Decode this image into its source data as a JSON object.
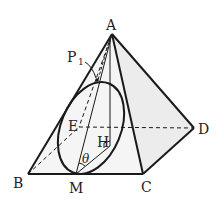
{
  "diagram": {
    "type": "square pyramid with inscribed ellipse cross-section",
    "colors": {
      "stroke": "#1a1a1a",
      "face_fill": "#ebebeb",
      "background": "#ffffff"
    },
    "points": {
      "A": {
        "label": "A",
        "x": 112,
        "y": 34
      },
      "B": {
        "label": "B",
        "x": 28,
        "y": 174
      },
      "C": {
        "label": "C",
        "x": 143,
        "y": 174
      },
      "D": {
        "label": "D",
        "x": 194,
        "y": 128
      },
      "E": {
        "label": "E",
        "x": 79,
        "y": 127
      },
      "M": {
        "label": "M",
        "x": 76,
        "y": 174
      },
      "H": {
        "label": "H",
        "x": 108,
        "y": 150
      },
      "P1": {
        "label": "P",
        "sub": "1",
        "x": 97,
        "y": 80
      }
    },
    "angle_label": "θ",
    "solid_edges": [
      "AB",
      "AC",
      "AD",
      "BC",
      "CD",
      "AM",
      "MH",
      "AH"
    ],
    "dashed_edges": [
      "AE",
      "BE",
      "ED"
    ],
    "ellipse": {
      "cx": 91,
      "cy": 128,
      "rx": 32,
      "ry": 48,
      "rotate": 22
    }
  }
}
